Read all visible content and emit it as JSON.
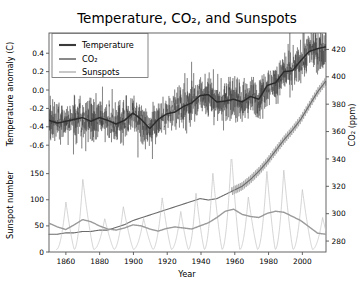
{
  "figure": {
    "title": "Temperature, CO₂, and Sunspots",
    "background": "#ffffff"
  },
  "legend": {
    "position": "upper-left",
    "entries": [
      {
        "label": "Temperature",
        "color": "#3a3a3a",
        "width": 1.6
      },
      {
        "label": "CO₂",
        "color": "#6b6b6b",
        "width": 1.2
      },
      {
        "label": "Sunspots",
        "color": "#a8a8a8",
        "width": 1.0
      }
    ]
  },
  "axes": {
    "x": {
      "label": "Year",
      "ticks": [
        1860,
        1880,
        1900,
        1920,
        1940,
        1960,
        1980,
        2000
      ],
      "range": [
        1850,
        2014
      ]
    },
    "y_temperature": {
      "label": "Temperature anomaly (C)",
      "ticks": [
        "0.4",
        "0.2",
        "0.0",
        "-0.2",
        "-0.4",
        "-0.6"
      ],
      "tick_values": [
        0.4,
        0.2,
        0.0,
        -0.2,
        -0.4,
        -0.6
      ],
      "range": [
        -0.75,
        0.62
      ],
      "side": "left"
    },
    "y_co2": {
      "label": "CO₂ (ppm)",
      "ticks": [
        420,
        400,
        380,
        360,
        340,
        320,
        300,
        280
      ],
      "range": [
        272,
        432
      ],
      "side": "right"
    },
    "y_sunspots": {
      "label": "Sunspot number",
      "ticks": [
        0,
        50,
        100,
        150
      ],
      "range": [
        0,
        178
      ],
      "side": "left"
    }
  },
  "chart_data": {
    "type": "line",
    "title": "Temperature, CO₂, and Sunspots",
    "xlabel": "Year",
    "ylabel": "Temperature anomaly (C) / Sunspot number",
    "ylabel_right": "CO₂ (ppm)",
    "grid": false,
    "legend_position": "upper left",
    "xlim": [
      1850,
      2014
    ],
    "x": [
      1850,
      1855,
      1860,
      1865,
      1870,
      1875,
      1880,
      1885,
      1890,
      1895,
      1900,
      1905,
      1910,
      1915,
      1920,
      1925,
      1930,
      1935,
      1940,
      1945,
      1950,
      1955,
      1960,
      1965,
      1970,
      1975,
      1980,
      1985,
      1990,
      1995,
      2000,
      2005,
      2010,
      2014
    ],
    "series": [
      {
        "name": "Temperature",
        "units": "C anomaly",
        "axis": "left-upper",
        "color": "#3a3a3a",
        "note": "monthly noisy record with heavy smoothed trend overlaid",
        "ylim": [
          -0.75,
          0.62
        ],
        "smoothed_values": [
          -0.33,
          -0.36,
          -0.34,
          -0.32,
          -0.3,
          -0.34,
          -0.3,
          -0.33,
          -0.37,
          -0.33,
          -0.25,
          -0.32,
          -0.42,
          -0.32,
          -0.26,
          -0.24,
          -0.18,
          -0.14,
          -0.06,
          -0.05,
          -0.13,
          -0.12,
          -0.1,
          -0.13,
          -0.07,
          -0.1,
          0.05,
          0.08,
          0.2,
          0.21,
          0.32,
          0.42,
          0.45,
          0.47
        ],
        "noise_amplitude": 0.22
      },
      {
        "name": "CO₂",
        "units": "ppm",
        "axis": "right",
        "color": "#6b6b6b",
        "ylim": [
          272,
          432
        ],
        "values": [
          285,
          285,
          286,
          286,
          287,
          287,
          288,
          288,
          290,
          292,
          295,
          297,
          299,
          301,
          303,
          305,
          307,
          309,
          311,
          310,
          311,
          314,
          317,
          320,
          325,
          331,
          338,
          346,
          354,
          361,
          369,
          379,
          389,
          397
        ],
        "note": "seasonal sawtooth oscillation visible after 1958"
      },
      {
        "name": "Sunspots",
        "units": "sunspot number",
        "axis": "left-lower",
        "color": "#a8a8a8",
        "ylim": [
          0,
          178
        ],
        "cycle_period_years": 11,
        "smoothed_values": [
          55,
          48,
          43,
          52,
          62,
          58,
          50,
          44,
          42,
          46,
          52,
          50,
          44,
          40,
          45,
          48,
          46,
          44,
          50,
          56,
          66,
          78,
          82,
          72,
          68,
          66,
          74,
          78,
          76,
          68,
          60,
          48,
          36,
          34
        ],
        "cycle_peaks": [
          {
            "year": 1860,
            "value": 96
          },
          {
            "year": 1870,
            "value": 140
          },
          {
            "year": 1883,
            "value": 64
          },
          {
            "year": 1894,
            "value": 87
          },
          {
            "year": 1906,
            "value": 64
          },
          {
            "year": 1917,
            "value": 104
          },
          {
            "year": 1928,
            "value": 78
          },
          {
            "year": 1937,
            "value": 114
          },
          {
            "year": 1947,
            "value": 152
          },
          {
            "year": 1958,
            "value": 190
          },
          {
            "year": 1968,
            "value": 106
          },
          {
            "year": 1979,
            "value": 155
          },
          {
            "year": 1989,
            "value": 158
          },
          {
            "year": 2000,
            "value": 120
          },
          {
            "year": 2012,
            "value": 66
          }
        ],
        "cycle_minima_value": 5
      }
    ]
  }
}
